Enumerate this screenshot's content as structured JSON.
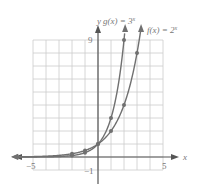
{
  "chart_data": {
    "type": "line",
    "title": "",
    "xlabel": "x",
    "ylabel": "y",
    "xlim": [
      -5,
      5
    ],
    "ylim": [
      -1,
      9
    ],
    "grid": true,
    "tick_labels": {
      "x": [
        "-5",
        "5"
      ],
      "y": [
        "9",
        "-1"
      ]
    },
    "series": [
      {
        "name": "g(x) = 3^x",
        "label": "g(x) = 3",
        "exponent": "x",
        "points": [
          [
            -2,
            0.111
          ],
          [
            -1,
            0.333
          ],
          [
            0,
            1
          ],
          [
            1,
            3
          ],
          [
            2,
            9
          ]
        ]
      },
      {
        "name": "f(x) = 2^x",
        "label": "f(x) = 2",
        "exponent": "x",
        "points": [
          [
            -2,
            0.25
          ],
          [
            -1,
            0.5
          ],
          [
            0,
            1
          ],
          [
            1,
            2
          ],
          [
            2,
            4
          ],
          [
            3,
            8
          ]
        ]
      }
    ],
    "colors": {
      "curves": "#707070",
      "axes": "#555555",
      "grid": "#cccccc",
      "text": "#777777"
    }
  },
  "labels": {
    "x_axis": "x",
    "y_axis": "y",
    "x_min": "−5",
    "x_max": "5",
    "y_max": "9",
    "y_min": "−1",
    "g_label": "g(x) = 3",
    "g_exp": "x",
    "f_label": "f(x) = 2",
    "f_exp": "x"
  }
}
